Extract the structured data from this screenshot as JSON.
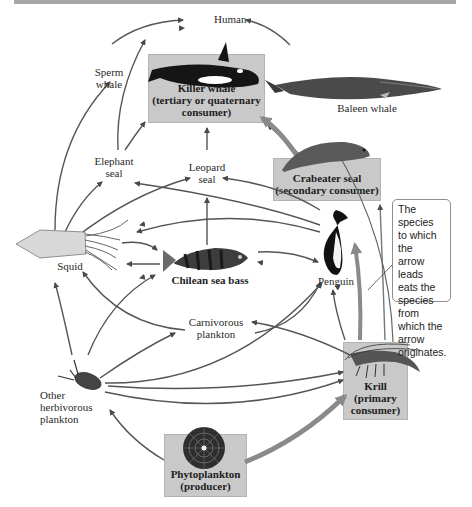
{
  "diagram": {
    "legend_note": "The species to which the arrow leads eats the species from which the arrow originates.",
    "nodes": [
      {
        "id": "human",
        "label": "Human",
        "highlighted": false
      },
      {
        "id": "sperm_whale",
        "label_lines": [
          "Sperm",
          "whale"
        ],
        "highlighted": false
      },
      {
        "id": "killer_whale",
        "label_lines": [
          "Killer whale",
          "(tertiary or quaternary",
          "consumer)"
        ],
        "highlighted": true,
        "role": "tertiary or quaternary consumer"
      },
      {
        "id": "baleen_whale",
        "label": "Baleen whale",
        "highlighted": false
      },
      {
        "id": "elephant_seal",
        "label_lines": [
          "Elephant",
          "seal"
        ],
        "highlighted": false
      },
      {
        "id": "leopard_seal",
        "label_lines": [
          "Leopard",
          "seal"
        ],
        "highlighted": false
      },
      {
        "id": "crabeater_seal",
        "label_lines": [
          "Crabeater seal",
          "(secondary consumer)"
        ],
        "highlighted": true,
        "role": "secondary consumer"
      },
      {
        "id": "squid",
        "label": "Squid",
        "highlighted": false
      },
      {
        "id": "chilean_sea_bass",
        "label": "Chilean sea bass",
        "highlighted": false,
        "bold": true
      },
      {
        "id": "penguin",
        "label": "Penguin",
        "highlighted": false
      },
      {
        "id": "carnivorous_plankton",
        "label_lines": [
          "Carnivorous",
          "plankton"
        ],
        "highlighted": false
      },
      {
        "id": "other_herbivorous_plankton",
        "label_lines": [
          "Other",
          "herbivorous",
          "plankton"
        ],
        "highlighted": false
      },
      {
        "id": "krill",
        "label_lines": [
          "Krill",
          "(primary",
          "consumer)"
        ],
        "highlighted": true,
        "role": "primary consumer"
      },
      {
        "id": "phytoplankton",
        "label_lines": [
          "Phytoplankton",
          "(producer)"
        ],
        "highlighted": true,
        "role": "producer"
      }
    ],
    "edges": [
      {
        "from": "sperm_whale",
        "to": "human"
      },
      {
        "from": "baleen_whale",
        "to": "human"
      },
      {
        "from": "squid",
        "to": "sperm_whale"
      },
      {
        "from": "squid",
        "to": "elephant_seal"
      },
      {
        "from": "squid",
        "to": "leopard_seal"
      },
      {
        "from": "elephant_seal",
        "to": "killer_whale"
      },
      {
        "from": "leopard_seal",
        "to": "killer_whale"
      },
      {
        "from": "crabeater_seal",
        "to": "killer_whale"
      },
      {
        "from": "krill",
        "to": "baleen_whale"
      },
      {
        "from": "krill",
        "to": "crabeater_seal"
      },
      {
        "from": "krill",
        "to": "penguin"
      },
      {
        "from": "krill",
        "to": "squid"
      },
      {
        "from": "krill",
        "to": "chilean_sea_bass"
      },
      {
        "from": "krill",
        "to": "carnivorous_plankton"
      },
      {
        "from": "penguin",
        "to": "leopard_seal"
      },
      {
        "from": "penguin",
        "to": "elephant_seal"
      },
      {
        "from": "penguin",
        "to": "squid"
      },
      {
        "from": "chilean_sea_bass",
        "to": "leopard_seal"
      },
      {
        "from": "chilean_sea_bass",
        "to": "elephant_seal"
      },
      {
        "from": "chilean_sea_bass",
        "to": "penguin"
      },
      {
        "from": "chilean_sea_bass",
        "to": "squid"
      },
      {
        "from": "squid",
        "to": "chilean_sea_bass"
      },
      {
        "from": "carnivorous_plankton",
        "to": "squid"
      },
      {
        "from": "carnivorous_plankton",
        "to": "chilean_sea_bass"
      },
      {
        "from": "carnivorous_plankton",
        "to": "penguin"
      },
      {
        "from": "other_herbivorous_plankton",
        "to": "squid"
      },
      {
        "from": "other_herbivorous_plankton",
        "to": "chilean_sea_bass"
      },
      {
        "from": "other_herbivorous_plankton",
        "to": "carnivorous_plankton"
      },
      {
        "from": "other_herbivorous_plankton",
        "to": "penguin"
      },
      {
        "from": "other_herbivorous_plankton",
        "to": "krill"
      },
      {
        "from": "phytoplankton",
        "to": "other_herbivorous_plankton"
      },
      {
        "from": "phytoplankton",
        "to": "krill"
      }
    ]
  },
  "labels": {
    "human": "Human",
    "sperm_whale_1": "Sperm",
    "sperm_whale_2": "whale",
    "killer_whale_1": "Killer whale",
    "killer_whale_2": "(tertiary or quaternary",
    "killer_whale_3": "consumer)",
    "baleen_whale": "Baleen whale",
    "elephant_seal_1": "Elephant",
    "elephant_seal_2": "seal",
    "leopard_seal_1": "Leopard",
    "leopard_seal_2": "seal",
    "crabeater_1": "Crabeater seal",
    "crabeater_2": "(secondary consumer)",
    "squid": "Squid",
    "sea_bass": "Chilean sea bass",
    "penguin": "Penguin",
    "carn_plankton_1": "Carnivorous",
    "carn_plankton_2": "plankton",
    "herb_plankton_1": "Other",
    "herb_plankton_2": "herbivorous",
    "herb_plankton_3": "plankton",
    "krill_1": "Krill",
    "krill_2": "(primary",
    "krill_3": "consumer)",
    "phyto_1": "Phytoplankton",
    "phyto_2": "(producer)",
    "note_1": "The species",
    "note_2": "to which the",
    "note_3": "arrow leads",
    "note_4": "eats the",
    "note_5": "species from",
    "note_6": "which the",
    "note_7": "arrow",
    "note_8": "originates."
  },
  "colors": {
    "highlight_box": "#c9c9c9",
    "arrow": "#555555",
    "thick_arrow": "#8a8a8a",
    "top_bar": "#a7a7a7"
  }
}
